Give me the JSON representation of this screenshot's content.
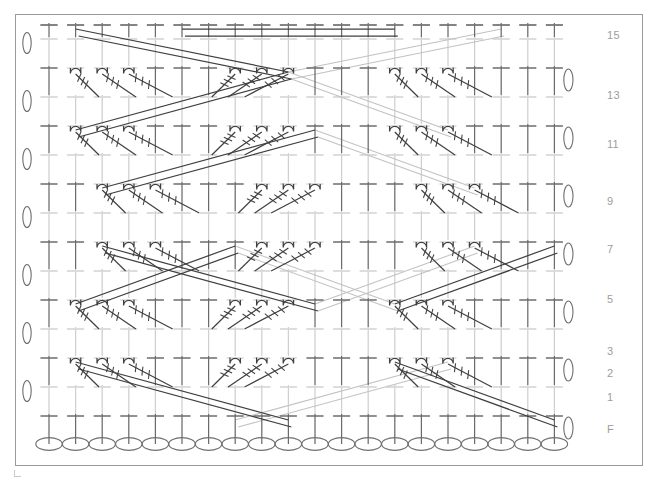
{
  "figure": {
    "kind": "crochet-symbol-chart",
    "width": 658,
    "height": 480,
    "frame": {
      "x": 15,
      "y": 14,
      "width": 628,
      "height": 452,
      "border_color": "#9a9a9a"
    }
  },
  "palette": {
    "ink_dark": "#3a3a3a",
    "ink_mid": "#6e6e6e",
    "ink_light": "#b9b9b9",
    "ink_faint": "#d2d2d2",
    "label_gray": "#9d9d9d",
    "background": "#ffffff"
  },
  "row_labels": [
    {
      "text": "15",
      "y": 36
    },
    {
      "text": "13",
      "y": 96
    },
    {
      "text": "11",
      "y": 145
    },
    {
      "text": "9",
      "y": 202
    },
    {
      "text": "7",
      "y": 250
    },
    {
      "text": "5",
      "y": 300
    },
    {
      "text": "3",
      "y": 352
    },
    {
      "text": "2",
      "y": 374
    },
    {
      "text": "1",
      "y": 398
    },
    {
      "text": "F",
      "y": 430
    }
  ],
  "grid": {
    "columns": 20,
    "column_x_start": 48,
    "column_spacing": 26.6,
    "rows": 16,
    "foundation_y": 443,
    "row_y": [
      443,
      413,
      384,
      355,
      326,
      297,
      268,
      239,
      210,
      181,
      152,
      123,
      94,
      65,
      36,
      22
    ]
  },
  "symbols": {
    "chain": {
      "name": "chain-stitch",
      "glyph": "oval",
      "count_foundation": 20
    },
    "treble": {
      "name": "treble-crochet",
      "glyph": "vertical-bar-with-crossbar"
    },
    "front_post": {
      "name": "front-post-treble",
      "glyph": "hook-with-post"
    },
    "turning_chain_left": {
      "name": "turning-chain-left",
      "count": 7
    },
    "turning_chain_right": {
      "name": "turning-chain-right",
      "count": 7
    }
  },
  "chart_data": {
    "type": "diagram",
    "legend": [
      {
        "symbol": "oval",
        "meaning": "chain"
      },
      {
        "symbol": "vertical bar with one crossbar",
        "meaning": "treble crochet"
      },
      {
        "symbol": "hooked post with bind marks",
        "meaning": "front post treble crochet (cable)"
      }
    ],
    "axis": {
      "y_ticks": [
        "F",
        "1",
        "2",
        "3",
        "5",
        "7",
        "9",
        "11",
        "13",
        "15"
      ],
      "x_stitch_count": 20
    },
    "cable_rows": [
      3,
      5,
      7,
      9,
      11,
      13,
      15
    ],
    "foundation_chain_count": 20
  }
}
